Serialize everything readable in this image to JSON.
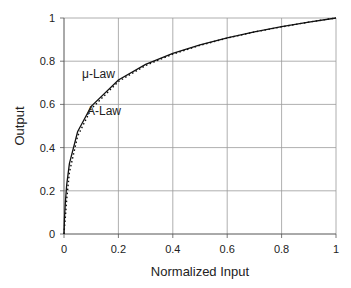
{
  "chart_data": {
    "type": "line",
    "title": "",
    "xlabel": "Normalized Input",
    "ylabel": "Output",
    "xlim": [
      0,
      1
    ],
    "ylim": [
      0,
      1
    ],
    "grid": true,
    "legend": "none (inline annotations)",
    "x_ticks": [
      "0",
      "0.2",
      "0.4",
      "0.6",
      "0.8",
      "1"
    ],
    "y_ticks": [
      "0",
      "0.2",
      "0.4",
      "0.6",
      "0.8",
      "1"
    ],
    "annotations": [
      {
        "text": "μ-Law",
        "x": 0.07,
        "y": 0.74
      },
      {
        "text": "A-Law",
        "x": 0.1,
        "y": 0.57
      }
    ],
    "series": [
      {
        "name": "μ-Law",
        "style": "solid",
        "x": [
          0,
          0.002,
          0.005,
          0.01,
          0.02,
          0.05,
          0.1,
          0.2,
          0.3,
          0.4,
          0.5,
          0.6,
          0.7,
          0.8,
          0.9,
          1.0
        ],
        "y": [
          0,
          0.074,
          0.148,
          0.228,
          0.326,
          0.473,
          0.591,
          0.713,
          0.785,
          0.836,
          0.876,
          0.908,
          0.936,
          0.96,
          0.981,
          1.0
        ]
      },
      {
        "name": "A-Law",
        "style": "dotted",
        "x": [
          0,
          0.002,
          0.005,
          0.01,
          0.02,
          0.05,
          0.1,
          0.2,
          0.3,
          0.4,
          0.5,
          0.6,
          0.7,
          0.8,
          0.9,
          1.0
        ],
        "y": [
          0,
          0.032,
          0.08,
          0.16,
          0.285,
          0.453,
          0.579,
          0.706,
          0.78,
          0.833,
          0.873,
          0.907,
          0.935,
          0.959,
          0.981,
          1.0
        ]
      }
    ]
  },
  "labels": {
    "xlabel": "Normalized Input",
    "ylabel": "Output",
    "mu_law": "μ-Law",
    "a_law": "A-Law"
  }
}
